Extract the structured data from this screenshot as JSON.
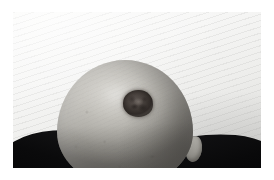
{
  "image": {
    "kind": "clinical-photograph",
    "subject": "bald-scalp-with-pigmented-lesion",
    "orientation": "landscape",
    "caption": "",
    "alt_text": "Close-up photograph of the top of a bald head showing a single dark, round, irregularly pigmented lesion on the right crown of the scalp.",
    "frame": {
      "margin_color": "#ffffff",
      "content_left": 13,
      "content_top": 12,
      "content_width": 248,
      "content_height": 156
    },
    "palette": {
      "page_background": "#ffffff",
      "backdrop_light": "#fbfbfa",
      "backdrop_mid": "#eeeeec",
      "backdrop_shadow": "#d8d8d6",
      "skin_highlight": "#d0cec8",
      "skin_mid": "#aeaca6",
      "skin_shadow": "#85837e",
      "lesion_core": "#3b3531",
      "lesion_rim": "#4a433f",
      "clothing_dark": "#0a0a0b"
    },
    "regions": [
      {
        "name": "backdrop",
        "label": "Light textured wall background with faint diagonal weave",
        "color": "#f2f2f1"
      },
      {
        "name": "head",
        "label": "Bald scalp, grey-toned skin, viewed from above and behind",
        "color": "#aeaca6"
      },
      {
        "name": "lesion",
        "label": "Dark brown pigmented lesion on right crown of scalp",
        "color": "#3b3531",
        "approx_diameter_px": 29,
        "center_x_px": 136,
        "center_y_px": 92
      },
      {
        "name": "ear",
        "label": "Right ear at lower right of head",
        "color": "#9b9993"
      },
      {
        "name": "shoulders",
        "label": "Dark clothing across shoulders at bottom of frame",
        "color": "#0a0a0b"
      }
    ]
  }
}
